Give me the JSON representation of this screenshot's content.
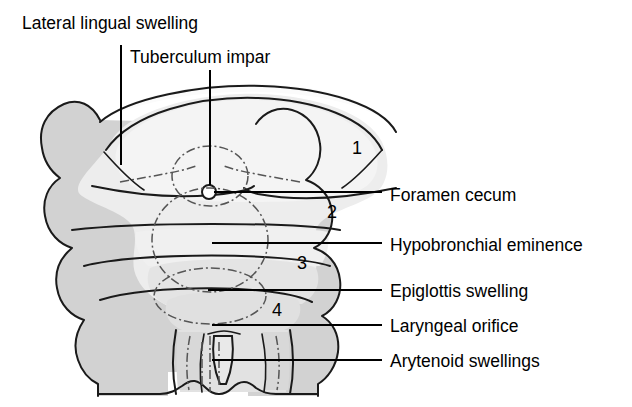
{
  "figure": {
    "background_color": "#ffffff",
    "ink_color": "#000000",
    "fills": {
      "arch_gray": "#d0d0d0",
      "mid_gray": "#dcdcdc",
      "light_gray": "#e8e8e8",
      "pale": "#f2f2f2",
      "white": "#fafafa"
    }
  },
  "labels": {
    "top": [
      {
        "id": "lateral-lingual-swelling",
        "text": "Lateral lingual swelling"
      },
      {
        "id": "tuberculum-impar",
        "text": "Tuberculum impar"
      }
    ],
    "right": [
      {
        "id": "foramen-cecum",
        "text": "Foramen cecum"
      },
      {
        "id": "hypobronchial-eminence",
        "text": "Hypobronchial eminence"
      },
      {
        "id": "epiglottis-swelling",
        "text": "Epiglottis swelling"
      },
      {
        "id": "laryngeal-orifice",
        "text": "Laryngeal orifice"
      },
      {
        "id": "arytenoid-swellings",
        "text": "Arytenoid swellings"
      }
    ]
  },
  "arch_numbers": [
    {
      "id": "arch-1",
      "text": "1"
    },
    {
      "id": "arch-2",
      "text": "2"
    },
    {
      "id": "arch-3",
      "text": "3"
    },
    {
      "id": "arch-4",
      "text": "4"
    }
  ]
}
